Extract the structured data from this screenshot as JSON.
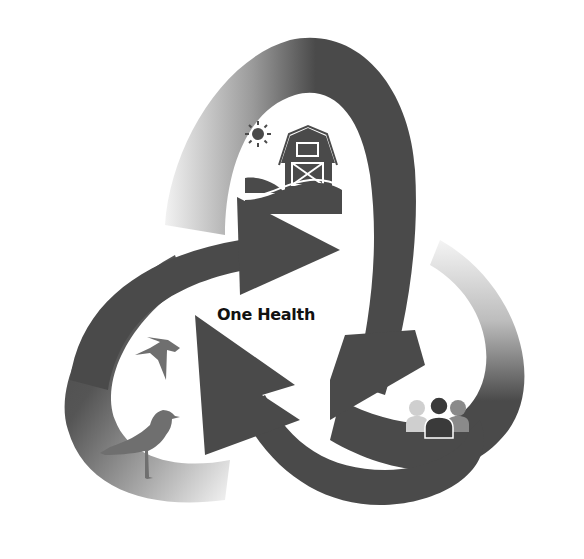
{
  "diagram": {
    "title": "One Health",
    "nodes": [
      {
        "id": "environment",
        "icon": "barn-sun-hills-icon",
        "position": "top"
      },
      {
        "id": "humans",
        "icon": "people-group-icon",
        "position": "bottom-right"
      },
      {
        "id": "animals",
        "icon": "birds-icon",
        "position": "bottom-left",
        "sub_icons": [
          "swallow-icon",
          "gull-icon"
        ]
      }
    ],
    "arrows": [
      {
        "id": "arrow-top-loop",
        "from": "left",
        "to": "right",
        "shade": "#4a4a4a"
      },
      {
        "id": "arrow-right-loop",
        "from": "top",
        "to": "bottom-left",
        "shade": "#4a4a4a"
      },
      {
        "id": "arrow-left-loop",
        "from": "bottom-right",
        "to": "top-left",
        "shade": "#4a4a4a"
      }
    ],
    "colors": {
      "dark": "#4a4a4a",
      "mid": "#6e6e6e",
      "light": "#d8d8d8",
      "text": "#111111",
      "people_left": "#cfcfcf",
      "people_center": "#3a3a3a",
      "people_right": "#8a8a8a",
      "bird": "#6f6f6f"
    }
  }
}
